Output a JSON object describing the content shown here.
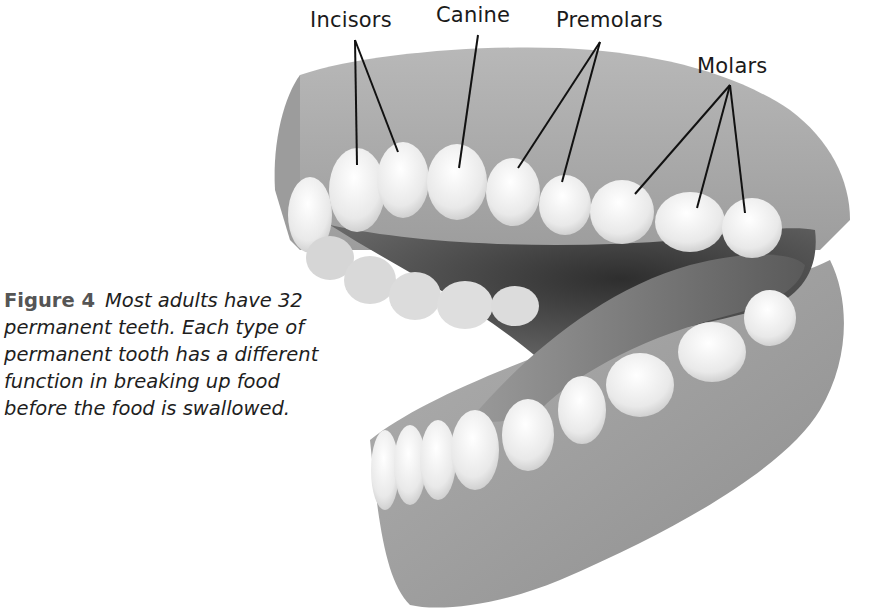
{
  "figure": {
    "number_label": "Figure 4",
    "caption": "Most adults have 32 permanent teeth. Each type of permanent tooth has a different function in breaking up food before the food is swallowed.",
    "image_subject": "Open human mouth model showing upper and lower permanent teeth"
  },
  "labels": {
    "incisors": "Incisors",
    "canine": "Canine",
    "premolars": "Premolars",
    "molars": "Molars"
  },
  "colors": {
    "gum": "#a9a9a9",
    "gum_dark": "#8a8a8a",
    "tooth": "#eeeeee",
    "mouth_cavity": "#4a4a4a",
    "tongue": "#7d7d7d",
    "leader_line": "#111111"
  }
}
